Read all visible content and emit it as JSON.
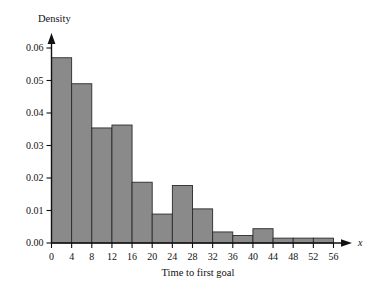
{
  "chart_data": {
    "type": "bar",
    "title": "",
    "subtitle": "",
    "xlabel": "Time to first goal",
    "ylabel": "Density",
    "x_axis_variable": "x",
    "grid": false,
    "legend": null,
    "bin_width": 4,
    "bin_edges": [
      0,
      4,
      8,
      12,
      16,
      20,
      24,
      28,
      32,
      36,
      40,
      44,
      48,
      52,
      56
    ],
    "categories": [
      "0-4",
      "4-8",
      "8-12",
      "12-16",
      "16-20",
      "20-24",
      "24-28",
      "28-32",
      "32-36",
      "36-40",
      "40-44",
      "44-48",
      "48-52",
      "52-56"
    ],
    "values": [
      0.057,
      0.049,
      0.0354,
      0.0363,
      0.0187,
      0.0089,
      0.0177,
      0.0105,
      0.0034,
      0.0023,
      0.0044,
      0.0015,
      0.0015,
      0.0015
    ],
    "xlim": [
      0,
      56
    ],
    "ylim": [
      0.0,
      0.06
    ],
    "xticks": [
      0,
      4,
      8,
      12,
      16,
      20,
      24,
      28,
      32,
      36,
      40,
      44,
      48,
      52,
      56
    ],
    "xtick_labels": [
      "0",
      "4",
      "8",
      "12",
      "16",
      "20",
      "24",
      "28",
      "32",
      "36",
      "40",
      "44",
      "48",
      "52",
      "56"
    ],
    "yticks": [
      0.0,
      0.01,
      0.02,
      0.03,
      0.04,
      0.05,
      0.06
    ],
    "ytick_labels": [
      "0.00",
      "0.01",
      "0.02",
      "0.03",
      "0.04",
      "0.05",
      "0.06"
    ],
    "bar_fill_color": "#8a8a8a",
    "bar_edge_color": "#2b2b2b",
    "axis_color": "#111111"
  }
}
